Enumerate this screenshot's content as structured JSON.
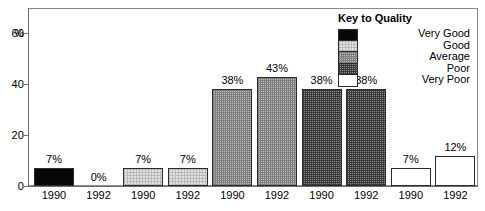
{
  "chart_data": {
    "type": "bar",
    "title": "",
    "xlabel": "",
    "ylabel": "%",
    "ylim": [
      0,
      70
    ],
    "yticks": [
      0,
      20,
      40,
      60
    ],
    "grid": false,
    "categories": [
      "1990",
      "1992",
      "1990",
      "1992",
      "1990",
      "1992",
      "1990",
      "1992",
      "1990",
      "1992"
    ],
    "values": [
      7,
      0,
      7,
      7,
      38,
      43,
      38,
      38,
      7,
      12
    ],
    "value_labels": [
      "7%",
      "0%",
      "7%",
      "7%",
      "38%",
      "43%",
      "38%",
      "38%",
      "7%",
      "12%"
    ],
    "groups": [
      {
        "quality": "Very Good",
        "pattern": "solid-black",
        "years": [
          "1990",
          "1992"
        ],
        "values": [
          7,
          0
        ]
      },
      {
        "quality": "Good",
        "pattern": "light-dotted",
        "years": [
          "1990",
          "1992"
        ],
        "values": [
          7,
          7
        ]
      },
      {
        "quality": "Average",
        "pattern": "medium-checker",
        "years": [
          "1990",
          "1992"
        ],
        "values": [
          38,
          43
        ]
      },
      {
        "quality": "Poor",
        "pattern": "dark-checker",
        "years": [
          "1990",
          "1992"
        ],
        "values": [
          38,
          38
        ]
      },
      {
        "quality": "Very Poor",
        "pattern": "white",
        "years": [
          "1990",
          "1992"
        ],
        "values": [
          7,
          12
        ]
      }
    ],
    "legend": {
      "title": "Key to Quality",
      "position": "top-right",
      "entries": [
        {
          "label": "Very Good",
          "pattern": "solid-black"
        },
        {
          "label": "Good",
          "pattern": "light-dotted"
        },
        {
          "label": "Average",
          "pattern": "medium-checker"
        },
        {
          "label": "Poor",
          "pattern": "dark-checker"
        },
        {
          "label": "Very Poor",
          "pattern": "white"
        }
      ]
    }
  },
  "axis": {
    "y_unit_label": "%",
    "y_tick_labels": [
      "60",
      "40",
      "20",
      "0"
    ]
  },
  "bars": [
    {
      "value_label": "7%",
      "year": "1990",
      "fill": "fill-verygood"
    },
    {
      "value_label": "0%",
      "year": "1992",
      "fill": "fill-verygood"
    },
    {
      "value_label": "7%",
      "year": "1990",
      "fill": "fill-good"
    },
    {
      "value_label": "7%",
      "year": "1992",
      "fill": "fill-good"
    },
    {
      "value_label": "38%",
      "year": "1990",
      "fill": "fill-average"
    },
    {
      "value_label": "43%",
      "year": "1992",
      "fill": "fill-average"
    },
    {
      "value_label": "38%",
      "year": "1990",
      "fill": "fill-poor"
    },
    {
      "value_label": "38%",
      "year": "1992",
      "fill": "fill-poor"
    },
    {
      "value_label": "7%",
      "year": "1990",
      "fill": "fill-verypoor"
    },
    {
      "value_label": "12%",
      "year": "1992",
      "fill": "fill-verypoor"
    }
  ],
  "legend": {
    "title": "Key to Quality",
    "items": [
      {
        "label": "Very Good",
        "fill": "fill-verygood"
      },
      {
        "label": "Good",
        "fill": "fill-good"
      },
      {
        "label": "Average",
        "fill": "fill-average"
      },
      {
        "label": "Poor",
        "fill": "fill-poor"
      },
      {
        "label": "Very Poor",
        "fill": "fill-verypoor"
      }
    ]
  },
  "colors": {
    "frame": "#8a8a8a",
    "axis": "#6d6d6d",
    "bar_outline": "#2b2b2b",
    "very_good": "#080808",
    "good": "#e3e3e3",
    "average": "#bdbdbd",
    "poor": "#8f8f8f",
    "very_poor": "#ffffff"
  }
}
